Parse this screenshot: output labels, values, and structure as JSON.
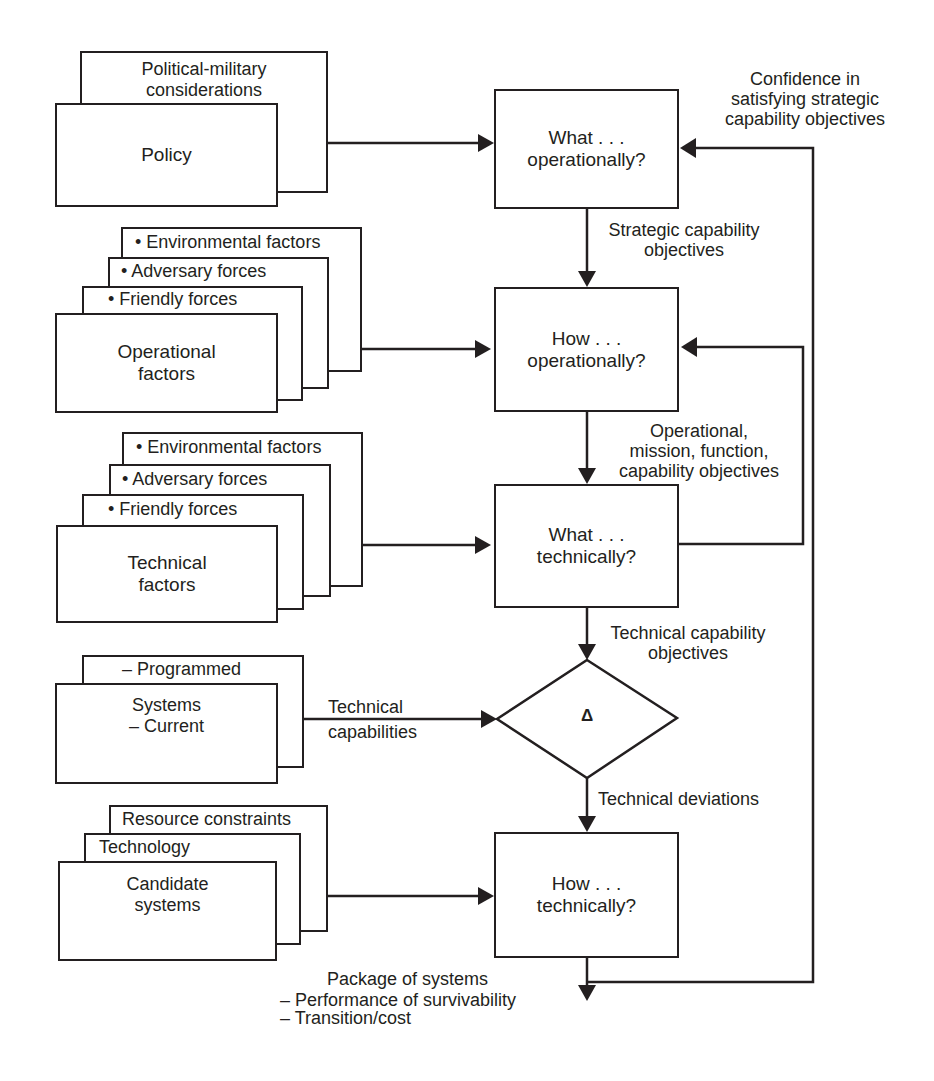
{
  "diagram": {
    "type": "flowchart",
    "inputs": {
      "policy": {
        "front_label": "Policy",
        "layers": [
          "Political-military considerations"
        ],
        "layer_lines": [
          "Political-military",
          "considerations"
        ]
      },
      "operational": {
        "front_label_lines": [
          "Operational",
          "factors"
        ],
        "layers": [
          "• Environmental factors",
          "• Adversary forces",
          "• Friendly forces"
        ]
      },
      "technical": {
        "front_label_lines": [
          "Technical",
          "factors"
        ],
        "layers": [
          "• Environmental factors",
          "• Adversary forces",
          "• Friendly forces"
        ]
      },
      "systems": {
        "front_label_lines": [
          "Systems",
          "–  Current"
        ],
        "layers": [
          "–  Programmed"
        ]
      },
      "candidate": {
        "front_label_lines": [
          "Candidate",
          "systems"
        ],
        "layers": [
          "Resource constraints",
          "Technology"
        ]
      }
    },
    "process": {
      "what_operationally": [
        "What . . .",
        "operationally?"
      ],
      "how_operationally": [
        "How . . .",
        "operationally?"
      ],
      "what_technically": [
        "What . . .",
        "technically?"
      ],
      "comparison_symbol": "Δ",
      "how_technically": [
        "How . . .",
        "technically?"
      ]
    },
    "edge_labels": {
      "confidence": [
        "Confidence in",
        "satisfying strategic",
        "capability objectives"
      ],
      "strategic_objectives": [
        "Strategic capability",
        "objectives"
      ],
      "operational_objectives": [
        "Operational,",
        "mission, function,",
        "capability objectives"
      ],
      "technical_objectives": [
        "Technical capability",
        "objectives"
      ],
      "technical_capabilities": [
        "Technical",
        "capabilities"
      ],
      "technical_deviations": "Technical deviations"
    },
    "output": {
      "title": "Package of systems",
      "items": [
        "–  Performance of survivability",
        "–  Transition/cost"
      ]
    },
    "colors": {
      "ink": "#231f20",
      "background": "#ffffff"
    }
  }
}
